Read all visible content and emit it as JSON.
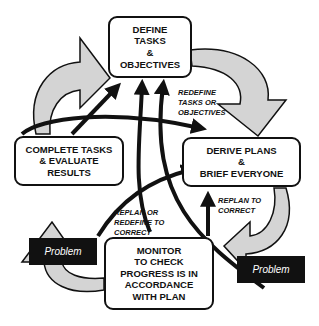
{
  "boxes": {
    "define": "DEFINE\nTASKS\n&\nOBJECTIVES",
    "complete": "COMPLETE TASKS\n& EVALUATE\nRESULTS",
    "derive": "DERIVE PLANS\n&\nBRIEF EVERYONE",
    "monitor": "MONITOR\nTO CHECK\nPROGRESS IS IN\nACCORDANCE\nWITH PLAN"
  },
  "labels": {
    "redefine": "REDEFINE\nTASKS OR\nOBJECTIVES",
    "replan_or_redefine": "REPLAN OR\nREDEFINE TO\nCORRECT",
    "replan": "REPLAN TO\nCORRECT"
  },
  "problems": {
    "left": "Problem",
    "right": "Problem"
  },
  "colors": {
    "ink": "#111111",
    "cycle_arrow_fill": "#d4d4d4"
  }
}
